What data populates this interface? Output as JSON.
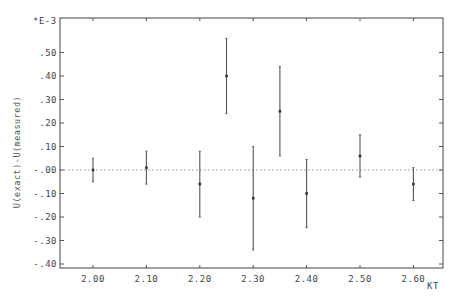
{
  "chart_data": {
    "type": "scatter",
    "subtype": "errorbar",
    "title": "",
    "xlabel": "KT",
    "ylabel": "U(exact)-U(measured)",
    "y_scale_label": "*E-3",
    "xlim": [
      1.94,
      2.665
    ],
    "ylim": [
      -0.42,
      0.645
    ],
    "x_ticks": [
      2.0,
      2.1,
      2.2,
      2.3,
      2.4,
      2.5,
      2.6
    ],
    "x_tick_labels": [
      "2.00",
      "2.10",
      "2.20",
      "2.30",
      "2.40",
      "2.50",
      "2.60"
    ],
    "y_ticks": [
      0.5,
      0.4,
      0.3,
      0.2,
      0.1,
      0.0,
      -0.1,
      -0.2,
      -0.3,
      -0.4
    ],
    "y_tick_labels": [
      ".50",
      ".40",
      ".30",
      ".20",
      ".10",
      "-.00",
      "-.10",
      "-.20",
      "-.30",
      "-.40"
    ],
    "reference_line": {
      "y": 0.0,
      "style": "dotted"
    },
    "grid": false,
    "legend": null,
    "series": [
      {
        "name": "U(exact)-U(measured)",
        "x": [
          2.0,
          2.1,
          2.2,
          2.25,
          2.3,
          2.35,
          2.4,
          2.5,
          2.6
        ],
        "y": [
          0.0,
          0.01,
          -0.06,
          0.4,
          -0.12,
          0.25,
          -0.1,
          0.06,
          -0.06
        ],
        "y_err": [
          0.05,
          0.07,
          0.14,
          0.16,
          0.22,
          0.19,
          0.145,
          0.09,
          0.07
        ]
      }
    ]
  },
  "colors": {
    "axis": "#555555",
    "errorbar": "#555555",
    "marker": "#333333",
    "reference": "#888888"
  }
}
